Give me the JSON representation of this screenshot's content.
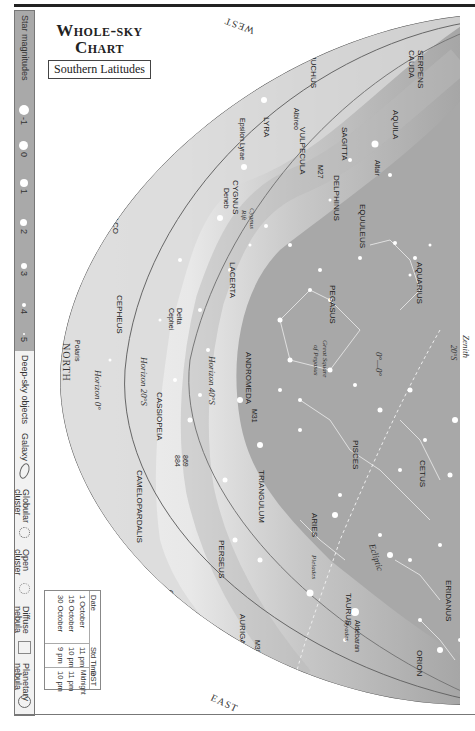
{
  "header": {
    "title_line1": "Whole-sky",
    "title_line2": "Chart",
    "subtitle": "Southern Latitudes"
  },
  "sidebar": {
    "magnitudes_label": "Star magnitudes",
    "magnitudes": [
      "-1",
      "0",
      "1",
      "2",
      "3",
      "4",
      "5"
    ],
    "deep_sky_label": "Deep-sky objects",
    "deep_sky": [
      {
        "label": "Galaxy",
        "icon": "galaxy-ellipse-icon"
      },
      {
        "label": "Globular cluster",
        "icon": "globular-cluster-icon"
      },
      {
        "label": "Open cluster",
        "icon": "open-cluster-icon"
      },
      {
        "label": "Diffuse nebula",
        "icon": "diffuse-nebula-square-icon"
      },
      {
        "label": "Planetary nebula",
        "icon": "planetary-nebula-icon"
      }
    ]
  },
  "time_table": {
    "headers": [
      "Date",
      "Std Time",
      "DST"
    ],
    "rows": [
      [
        "1 October",
        "11 pm",
        "Midnight"
      ],
      [
        "15 October",
        "10 pm",
        "11 pm"
      ],
      [
        "30 October",
        "9 pm",
        "10 pm"
      ]
    ]
  },
  "directions": {
    "west": "WEST",
    "east": "EAST",
    "north": "NORTH"
  },
  "horizons": {
    "h0": "Horizon 0°",
    "h20": "Horizon 20°S",
    "h40": "Horizon 40°S",
    "zenith": "Zenith 20°S",
    "ecliptic": "Ecliptic",
    "equator_mark": "0°—0°"
  },
  "constellations": [
    "SERPENS CAUDA",
    "OPHIUCHUS",
    "AQUILA",
    "SAGITTA",
    "VULPECULA",
    "LYRA",
    "DELPHINUS",
    "EQUULEUS",
    "CYGNUS",
    "AQUARIUS",
    "PEGASUS",
    "LACERTA",
    "DRACO",
    "CEPHEUS",
    "ANDROMEDA",
    "PISCES",
    "CETUS",
    "CASSIOPEIA",
    "TRIANGULUM",
    "ARIES",
    "CAMELOPARDALIS",
    "PERSEUS",
    "TAURUS",
    "ERIDANUS",
    "AURIGA",
    "ORION"
  ],
  "stars": [
    "Altair",
    "Vega",
    "Albireo",
    "Epsilon Lyrae",
    "Deneb",
    "Delta Cephei",
    "Polaris",
    "Capella",
    "Aldebaran"
  ],
  "objects": [
    "M27",
    "Cygnus Rift",
    "Great Square of Pegasus",
    "M31",
    "869",
    "884",
    "Pleiades",
    "Hyades",
    "M38",
    "M36"
  ],
  "colors": {
    "sky_dark": "#a4a4a4",
    "sky_mid": "#c4c4c4",
    "sky_light": "#e2e2e2",
    "sidebar_gray": "#a9a9a9",
    "line": "#555555"
  }
}
